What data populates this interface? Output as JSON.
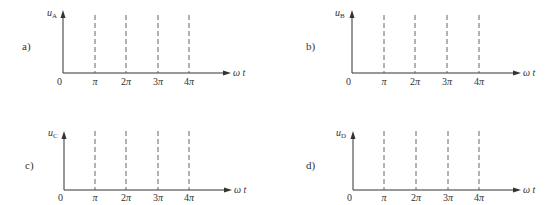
{
  "figure": {
    "line_color": "#333333",
    "dash_color": "#555555",
    "panels": [
      {
        "id": "a",
        "label": "a)",
        "y_symbol": "u",
        "y_subscript": "A",
        "origin": "0",
        "x_symbol": "ω t",
        "ticks": [
          {
            "coef": "",
            "sym": "π"
          },
          {
            "coef": "2",
            "sym": "π"
          },
          {
            "coef": "3",
            "sym": "π"
          },
          {
            "coef": "4",
            "sym": "π"
          }
        ]
      },
      {
        "id": "b",
        "label": "b)",
        "y_symbol": "u",
        "y_subscript": "B",
        "origin": "0",
        "x_symbol": "ω t",
        "ticks": [
          {
            "coef": "",
            "sym": "π"
          },
          {
            "coef": "2",
            "sym": "π"
          },
          {
            "coef": "3",
            "sym": "π"
          },
          {
            "coef": "4",
            "sym": "π"
          }
        ]
      },
      {
        "id": "c",
        "label": "c)",
        "y_symbol": "u",
        "y_subscript": "C",
        "origin": "0",
        "x_symbol": "ω t",
        "ticks": [
          {
            "coef": "",
            "sym": "π"
          },
          {
            "coef": "2",
            "sym": "π"
          },
          {
            "coef": "3",
            "sym": "π"
          },
          {
            "coef": "4",
            "sym": "π"
          }
        ]
      },
      {
        "id": "d",
        "label": "d)",
        "y_symbol": "u",
        "y_subscript": "D",
        "origin": "0",
        "x_symbol": "ω t",
        "ticks": [
          {
            "coef": "",
            "sym": "π"
          },
          {
            "coef": "2",
            "sym": "π"
          },
          {
            "coef": "3",
            "sym": "π"
          },
          {
            "coef": "4",
            "sym": "π"
          }
        ]
      }
    ]
  }
}
